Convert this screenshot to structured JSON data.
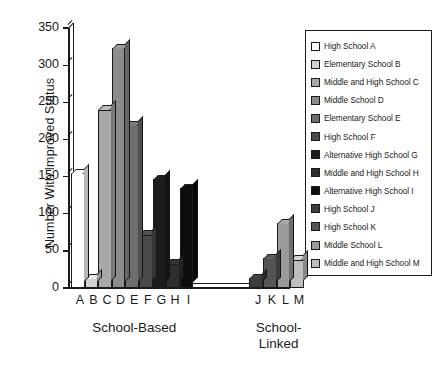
{
  "chart_data": {
    "type": "bar",
    "title": "",
    "xlabel": "",
    "ylabel": "Number With Improved Status",
    "ylim": [
      0,
      350
    ],
    "ytick_values": [
      350,
      300,
      250,
      200,
      150,
      100,
      50,
      0
    ],
    "ytick_labels": [
      "350",
      "300",
      "250",
      "200",
      "150",
      "100",
      "50",
      "0"
    ],
    "grid": false,
    "legend_position": "right",
    "categories": [
      "A",
      "B",
      "C",
      "D",
      "E",
      "F",
      "G",
      "H",
      "I",
      "J",
      "K",
      "L",
      "M"
    ],
    "values": [
      155,
      13,
      240,
      323,
      219,
      72,
      147,
      33,
      134,
      13,
      40,
      87,
      38
    ],
    "colors": [
      "#ffffff",
      "#d2d2d2",
      "#a8a8a8",
      "#8c8c8c",
      "#6e6e6e",
      "#4a4a4a",
      "#1c1c1c",
      "#2e2e2e",
      "#0d0d0d",
      "#3c3c3c",
      "#555555",
      "#9a9a9a",
      "#bdbdbd"
    ],
    "groups": [
      {
        "label": "School-Based",
        "categories": [
          "A",
          "B",
          "C",
          "D",
          "E",
          "F",
          "G",
          "H",
          "I"
        ]
      },
      {
        "label": "School-\nLinked",
        "categories": [
          "J",
          "K",
          "L",
          "M"
        ]
      }
    ],
    "legend": [
      {
        "key": "A",
        "label": "High School A"
      },
      {
        "key": "B",
        "label": "Elementary School B"
      },
      {
        "key": "C",
        "label": "Middle and High School C"
      },
      {
        "key": "D",
        "label": "Middle School D"
      },
      {
        "key": "E",
        "label": "Elementary School E"
      },
      {
        "key": "F",
        "label": "High School F"
      },
      {
        "key": "G",
        "label": "Alternative High School G"
      },
      {
        "key": "H",
        "label": "Middle and High School H"
      },
      {
        "key": "I",
        "label": "Alternative High School I"
      },
      {
        "key": "J",
        "label": "High School J"
      },
      {
        "key": "K",
        "label": "High School K"
      },
      {
        "key": "L",
        "label": "Middle School L"
      },
      {
        "key": "M",
        "label": "Middle and High School M"
      }
    ]
  }
}
